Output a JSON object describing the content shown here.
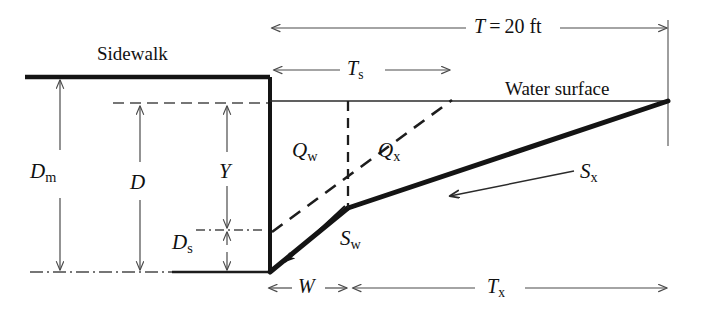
{
  "figure": {
    "type": "engineering-cross-section",
    "background_color": "#ffffff",
    "line_color": "#1a1a1a",
    "thin_line_color": "#555555"
  },
  "labels": {
    "sidewalk": "Sidewalk",
    "water_surface": "Water surface",
    "top_width_total": "T = 20 ft",
    "top_width_total_symbol": "T",
    "top_width_total_value": "20 ft",
    "t_sub_s": {
      "base": "T",
      "sub": "s"
    },
    "d_sub_m": {
      "base": "D",
      "sub": "m"
    },
    "d": {
      "base": "D",
      "sub": ""
    },
    "y": {
      "base": "Y",
      "sub": ""
    },
    "d_sub_s": {
      "base": "D",
      "sub": "s"
    },
    "q_sub_w": {
      "base": "Q",
      "sub": "w"
    },
    "q_sub_x": {
      "base": "Q",
      "sub": "x"
    },
    "s_sub_w": {
      "base": "S",
      "sub": "w"
    },
    "s_sub_x": {
      "base": "S",
      "sub": "x"
    },
    "w": {
      "base": "W",
      "sub": ""
    },
    "t_sub_x": {
      "base": "T",
      "sub": "x"
    }
  },
  "dimensions": {
    "canvas_width": 702,
    "canvas_height": 313,
    "horizontal": [
      {
        "name": "T",
        "label": "T = 20 ft",
        "x_start": 272,
        "x_end": 668,
        "y": 28
      },
      {
        "name": "Ts",
        "label": "Ts",
        "x_start": 272,
        "x_end": 450,
        "y": 70
      },
      {
        "name": "W",
        "label": "W",
        "x_start": 268,
        "x_end": 348,
        "y": 288
      },
      {
        "name": "Tx",
        "label": "Tx",
        "x_start": 352,
        "x_end": 668,
        "y": 288
      }
    ],
    "vertical": [
      {
        "name": "Dm",
        "label": "Dm",
        "x": 60,
        "y_start": 78,
        "y_end": 272
      },
      {
        "name": "D",
        "label": "D",
        "x": 140,
        "y_start": 103,
        "y_end": 272
      },
      {
        "name": "Y",
        "label": "Y",
        "x": 227,
        "y_start": 103,
        "y_end": 230
      },
      {
        "name": "Ds",
        "label": "Ds",
        "x": 227,
        "y_start": 230,
        "y_end": 272
      }
    ]
  },
  "geometry": {
    "sidewalk_top_y": 77,
    "sidewalk_left_x": 25,
    "curb_face_x": 270,
    "water_surface_y": 101,
    "water_surface_right_x": 668,
    "gutter_bottom_y": 272,
    "gutter_break_point": {
      "x": 348,
      "y": 208
    },
    "datum_dash_y": 103,
    "ds_dash_y": 230
  },
  "annotations": {
    "slope_arrows": [
      {
        "name": "Sw",
        "label": "Sw",
        "from": {
          "x": 345,
          "y": 207
        },
        "to": {
          "x": 282,
          "y": 265
        }
      },
      {
        "name": "Sx",
        "label": "Sx",
        "from": {
          "x": 573,
          "y": 172
        },
        "to": {
          "x": 444,
          "y": 197
        }
      }
    ],
    "flow_regions": [
      {
        "name": "Qw",
        "label": "Qw",
        "x": 300,
        "y": 152
      },
      {
        "name": "Qx",
        "label": "Qx",
        "x": 385,
        "y": 152
      }
    ]
  }
}
